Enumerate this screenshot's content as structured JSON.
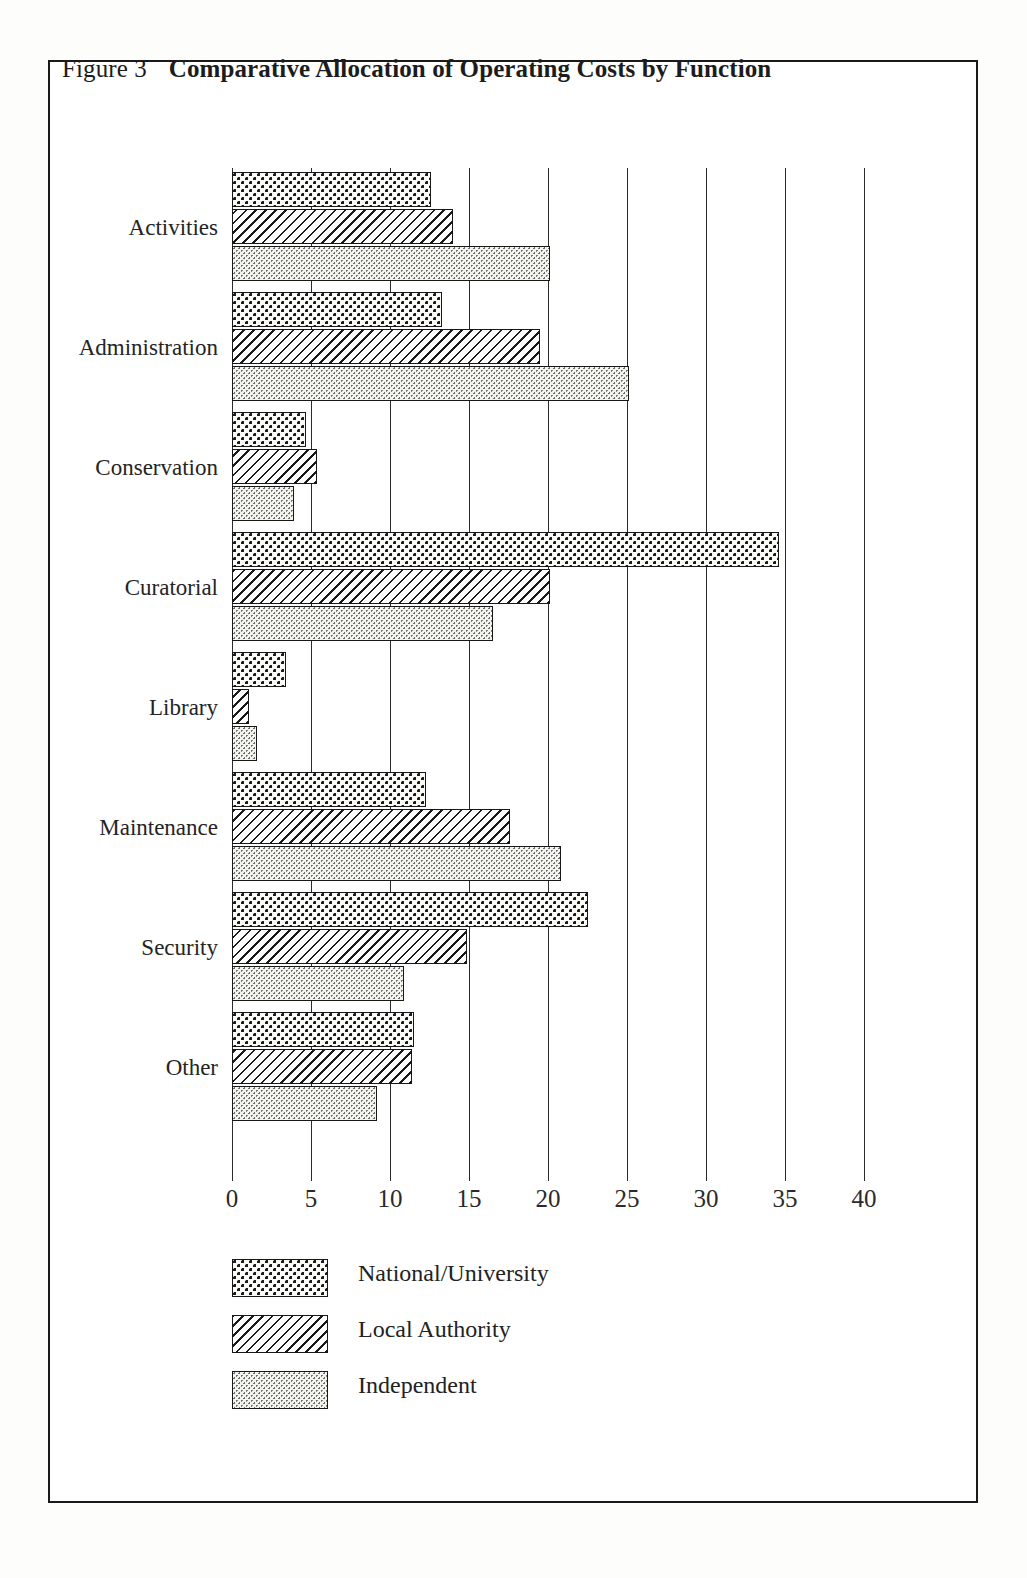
{
  "figure": {
    "label": "Figure 3",
    "caption": "Comparative Allocation of Operating Costs by Function"
  },
  "legend": {
    "items": [
      {
        "key": "national",
        "label": "National/University",
        "pattern": "coarse-stipple"
      },
      {
        "key": "local",
        "label": "Local Authority",
        "pattern": "diagonal-hatch"
      },
      {
        "key": "independent",
        "label": "Independent",
        "pattern": "fine-stipple"
      }
    ]
  },
  "chart_data": {
    "type": "bar",
    "orientation": "horizontal",
    "title": "Comparative Allocation of Operating Costs by Function",
    "subtitle": "",
    "xlabel": "",
    "ylabel": "",
    "xlim": [
      0,
      40
    ],
    "xticks": [
      0,
      5,
      10,
      15,
      20,
      25,
      30,
      35,
      40
    ],
    "xtick_labels": [
      "0",
      "5",
      "10",
      "15",
      "20",
      "25",
      "30",
      "35",
      "40"
    ],
    "grid": "vertical",
    "legend_position": "below-left",
    "categories": [
      "Activities",
      "Administration",
      "Conservation",
      "Curatorial",
      "Library",
      "Maintenance",
      "Security",
      "Other"
    ],
    "series": [
      {
        "name": "National/University",
        "values": [
          12.6,
          13.3,
          4.7,
          34.6,
          3.4,
          12.3,
          22.5,
          11.5
        ]
      },
      {
        "name": "Local Authority",
        "values": [
          14.0,
          19.5,
          5.4,
          20.1,
          1.1,
          17.6,
          14.9,
          11.4
        ]
      },
      {
        "name": "Independent",
        "values": [
          20.1,
          25.1,
          3.9,
          16.5,
          1.6,
          20.8,
          10.9,
          9.2
        ]
      }
    ]
  },
  "colors": {
    "ink": "#1a1a1a",
    "paper": "#ffffff",
    "grid": "#2b2b2b"
  }
}
